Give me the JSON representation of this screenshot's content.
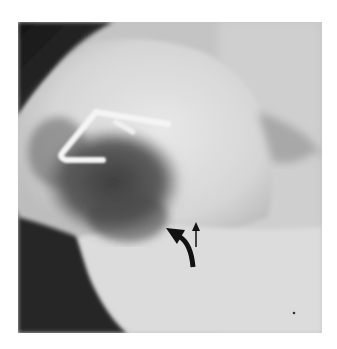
{
  "image": {
    "kind": "radiograph",
    "description": "Grayscale lateral X-ray of a joint region with a metallic surgical staple and two black arrows marking features",
    "background": "#ffffff",
    "tones": {
      "dark_corner": "#1e1e1e",
      "soft_tissue": "#c8c8c8",
      "bone_light": "#e4e4e4",
      "dark_cavity": "#4a4a4a",
      "staple": "#f6f6f6",
      "arrow": "#111111"
    }
  },
  "annotations": {
    "arrows": [
      {
        "type": "curved-thick",
        "direction": "up-left",
        "x": 175,
        "y": 245
      },
      {
        "type": "straight-thin",
        "direction": "up",
        "x": 197,
        "y": 235
      }
    ],
    "implants": [
      {
        "type": "staple",
        "x": 90,
        "y": 130
      }
    ]
  }
}
